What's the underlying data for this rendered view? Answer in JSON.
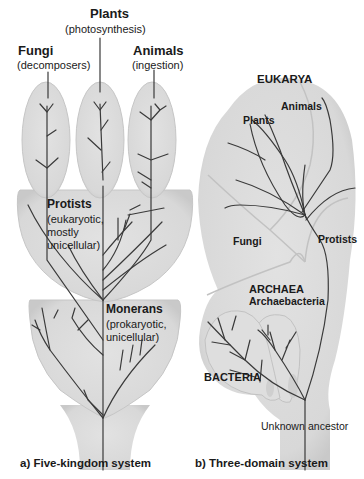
{
  "panel_a": {
    "caption": "a) Five-kingdom system",
    "kingdoms": [
      {
        "name": "Plants",
        "note": "(photosynthesis)"
      },
      {
        "name": "Fungi",
        "note": "(decomposers)"
      },
      {
        "name": "Animals",
        "note": "(ingestion)"
      },
      {
        "name": "Protists",
        "note_lines": [
          "(eukaryotic,",
          "mostly",
          "unicellular)"
        ]
      },
      {
        "name": "Monerans",
        "note_lines": [
          "(prokaryotic,",
          "unicellular)"
        ]
      }
    ]
  },
  "panel_b": {
    "caption": "b) Three-domain system",
    "domains": {
      "eukarya": "EUKARYA",
      "archaea": "ARCHAEA",
      "archaea_sub": "Archaebacteria",
      "bacteria": "BACTERIA"
    },
    "groups": {
      "plants": "Plants",
      "animals": "Animals",
      "fungi": "Fungi",
      "protists": "Protists"
    },
    "root": {
      "word1": "Unknown",
      "word2": "ancestor"
    }
  },
  "colors": {
    "fill": "#dcdcdc",
    "fill_edge": "#c4c4c4",
    "branch": "#3a3a3a",
    "text": "#1a1a1a"
  }
}
